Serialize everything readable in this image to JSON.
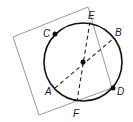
{
  "diagram": {
    "type": "geometry",
    "colors": {
      "square": "#9a9a9a",
      "circle": "#111111",
      "dashed": "#222222",
      "points": "#111111"
    },
    "circle": {
      "cx": 83,
      "cy": 62,
      "r": 39
    },
    "center_point": {
      "x": 83,
      "y": 62
    },
    "square": {
      "corners": [
        [
          13,
          37
        ],
        [
          88,
          7
        ],
        [
          112,
          88
        ],
        [
          39,
          115
        ]
      ]
    },
    "points": {
      "A": {
        "x": 55,
        "y": 88,
        "label": "A",
        "label_x": 45,
        "label_y": 95
      },
      "B": {
        "x": 114,
        "y": 38,
        "label": "B",
        "label_x": 115,
        "label_y": 36
      },
      "C": {
        "x": 55,
        "y": 34,
        "label": "C",
        "label_x": 43,
        "label_y": 37
      },
      "D": {
        "x": 113,
        "y": 88,
        "label": "D",
        "label_x": 117,
        "label_y": 95
      },
      "E": {
        "x": 90,
        "y": 22,
        "label": "E",
        "label_x": 88,
        "label_y": 19
      },
      "F": {
        "x": 77,
        "y": 101,
        "label": "F",
        "label_x": 73,
        "label_y": 117
      }
    },
    "diameters": [
      {
        "from": "A",
        "to": "B",
        "style": "dashed"
      },
      {
        "from": "E",
        "to": "F",
        "style": "dashed"
      }
    ],
    "filled_points": [
      "C",
      "D",
      "center"
    ]
  }
}
